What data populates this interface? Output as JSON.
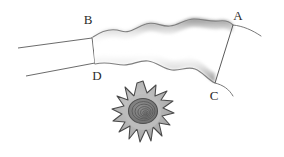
{
  "figure": {
    "background_color": "#ffffff",
    "width": 284,
    "height": 157,
    "labels": [
      {
        "id": "A",
        "text": "A",
        "x": 238,
        "y": 20,
        "corner": "top-right"
      },
      {
        "id": "B",
        "text": "B",
        "x": 88,
        "y": 24,
        "corner": "top-left"
      },
      {
        "id": "C",
        "text": "C",
        "x": 214,
        "y": 100,
        "corner": "bottom-right"
      },
      {
        "id": "D",
        "text": "D",
        "x": 97,
        "y": 80,
        "corner": "bottom-left"
      }
    ],
    "colors": {
      "stroke": "#555555",
      "label_text": "#2b2b2b",
      "band_edge_dark": "#8c8c8c",
      "band_fill": "#ffffff",
      "cell_body": "#b4b4b4",
      "cell_outline": "#4a4a4a",
      "cell_nucleus": "#7a7a7a",
      "cell_rings": "#5a5a5a"
    },
    "band": {
      "name": "wavy-band",
      "description": "Horizontal wavy-edged band running from left corners B/D to right corners A/C",
      "top_wave_count": 6,
      "bottom_wave_count": 6,
      "edge_shading": "soft gray gradient fading to white interior"
    },
    "leader_lines": {
      "name": "left-guide-lines",
      "count": 2,
      "description": "Two near-parallel straight lines entering from lower-left and meeting points B and D"
    },
    "tails": [
      {
        "id": "tail-A",
        "description": "Short curve extending right and down from point A"
      },
      {
        "id": "tail-C",
        "description": "Short curve extending right and up from point C"
      }
    ],
    "cell": {
      "name": "spiky-stellate-cell",
      "center_x": 143,
      "center_y": 112,
      "radius": 30,
      "spike_count": 16,
      "nucleus_ring_count": 6,
      "description": "Spiky star-shaped cell with concentric ring nucleus"
    }
  }
}
